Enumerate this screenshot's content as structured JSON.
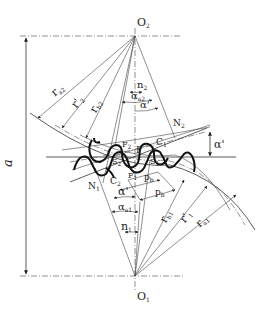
{
  "diagram": {
    "labels": {
      "o2": "O",
      "o2_sub": "2",
      "o1": "O",
      "o1_sub": "1",
      "a": "a",
      "ra2": "r",
      "ra2_sub": "a2",
      "r2p": "r'",
      "r2p_sub": "2",
      "rb2": "r",
      "rb2_sub": "b2",
      "n2": "n",
      "n2_sub": "2",
      "alpha_a2": "α",
      "alpha_a2_sub": "a2",
      "alpha_prime_top": "α'",
      "N2": "N",
      "N2_sub": "2",
      "C1": "C",
      "C1_sub": "1",
      "F2": "F",
      "F2_sub": "2",
      "P": "P",
      "alpha_prime_right": "α'",
      "S2": "S",
      "S2_sub": "2",
      "S1": "S",
      "S1_sub": "1",
      "N1": "N",
      "N1_sub": "1",
      "C2": "C",
      "C2_sub": "2",
      "F1": "F",
      "F1_sub": "1",
      "pb_upper": "p",
      "pb_upper_sub": "b",
      "pb_lower": "p",
      "pb_lower_sub": "b",
      "alpha_prime_bottom": "α'",
      "alpha_a1": "α",
      "alpha_a1_sub": "a1",
      "n1": "n",
      "n1_sub": "1",
      "rb1": "r",
      "rb1_sub": "b1",
      "r1p": "r'",
      "r1p_sub": "1",
      "ra1": "r",
      "ra1_sub": "a1"
    }
  }
}
